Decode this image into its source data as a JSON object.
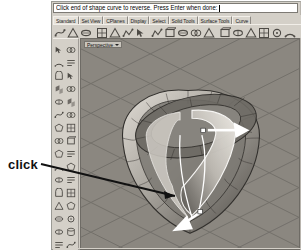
{
  "annotation": {
    "label": "click"
  },
  "command_bar": {
    "prompt": "Click end of shape curve to reverse. Press Enter when done:",
    "caret": ""
  },
  "tab_bar": {
    "tabs": [
      {
        "label": "Standard",
        "active": true
      },
      {
        "label": "Set View",
        "active": false
      },
      {
        "label": "CPlanes",
        "active": false
      },
      {
        "label": "Display",
        "active": false
      },
      {
        "label": "Select",
        "active": false
      },
      {
        "label": "Solid Tools",
        "active": false
      },
      {
        "label": "Surface Tools",
        "active": false
      },
      {
        "label": "Curve",
        "active": false
      }
    ]
  },
  "top_toolbar": {
    "icons": [
      "select-objects-icon",
      "select-by-filter-icon",
      "point-object-icon",
      "polyline-icon",
      "curve-interpolate-icon",
      "curve-control-points-icon",
      "circle-center-icon",
      "arc-center-icon",
      "ellipse-icon",
      "rectangle-icon",
      "polygon-icon",
      "freeform-curve-icon",
      "surface-from-curves-icon",
      "extrude-surface-icon",
      "revolve-surface-icon",
      "sweep-1-rail-icon",
      "sweep-2-rail-icon",
      "loft-surface-icon",
      "box-solid-icon",
      "sphere-solid-icon",
      "cylinder-solid-icon",
      "trim-icon",
      "split-icon",
      "fillet-icon"
    ]
  },
  "left_palette": {
    "icons": [
      "select-arrow-icon",
      "point-icon",
      "polyline-icon",
      "line-segment-icon",
      "curve-icon",
      "arc-icon",
      "circle-icon",
      "ellipse-icon",
      "rectangle-icon",
      "polygon-icon",
      "surface-plane-icon",
      "surface-edge-curves-icon",
      "extrude-icon",
      "revolve-icon",
      "loft-icon",
      "sweep-icon",
      "box-icon",
      "sphere-icon",
      "cylinder-icon",
      "cone-icon",
      "boolean-union-icon",
      "boolean-difference-icon",
      "fillet-edge-icon",
      "shell-icon",
      "transform-move-icon",
      "rotate-icon",
      "scale-icon",
      "mirror-icon",
      "array-icon",
      "trim-icon",
      "split-icon",
      "join-icon",
      "explode-icon",
      "offset-icon",
      "analyze-icon",
      "render-icon",
      "lights-icon",
      "materials-icon",
      "layers-icon",
      "properties-icon",
      "dimension-icon",
      "text-icon",
      "hatch-icon",
      "print-icon"
    ]
  },
  "viewport": {
    "title": "Perspective",
    "background_color": "#8b8780",
    "grid_color": "#6f6c66",
    "model": {
      "name": "ring-band-surface",
      "wireframe_color": "#3a3835",
      "shading_light": "#d6d2cb",
      "shading_dark": "#55524c"
    },
    "markers": [
      {
        "name": "curve-direction-arrow-upper",
        "color": "#ffffff",
        "description": "white arrow pointing right at upper shape curve end"
      },
      {
        "name": "curve-direction-arrow-lower",
        "color": "#ffffff",
        "description": "white arrow pointing down-left at lower shape curve end"
      },
      {
        "name": "curve-end-point-upper",
        "color": "#ffffff"
      },
      {
        "name": "curve-end-point-lower",
        "color": "#ffffff"
      }
    ]
  },
  "colors": {
    "chrome": "#d4d0c8",
    "viewport_bg": "#8b8780",
    "accent_white": "#ffffff",
    "text": "#000000"
  }
}
